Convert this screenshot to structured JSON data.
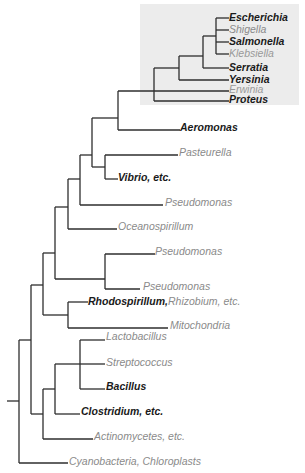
{
  "diagram": {
    "type": "phylogenetic-tree",
    "highlight_box": {
      "color": "#ececec"
    },
    "line_color": "#2e2e2e",
    "colors": {
      "highlighted_taxon": "#1a1a1a",
      "other_taxon": "#8a8a8a"
    },
    "taxa": [
      {
        "id": "escherichia",
        "label": "Escherichia",
        "emphasis": true
      },
      {
        "id": "shigella",
        "label": "Shigella",
        "emphasis": false
      },
      {
        "id": "salmonella",
        "label": "Salmonella",
        "emphasis": true
      },
      {
        "id": "klebsiella",
        "label": "Klebsiella",
        "emphasis": false
      },
      {
        "id": "serratia",
        "label": "Serratia",
        "emphasis": true
      },
      {
        "id": "yersinia",
        "label": "Yersinia",
        "emphasis": true
      },
      {
        "id": "erwinia",
        "label": "Erwinia",
        "emphasis": false
      },
      {
        "id": "proteus",
        "label": "Proteus",
        "emphasis": true
      },
      {
        "id": "aeromonas",
        "label": "Aeromonas",
        "emphasis": true
      },
      {
        "id": "pasteurella",
        "label": "Pasteurella",
        "emphasis": false
      },
      {
        "id": "vibrio",
        "label": "Vibrio, etc.",
        "emphasis": true
      },
      {
        "id": "pseudomonas-1",
        "label": "Pseudomonas",
        "emphasis": false
      },
      {
        "id": "oceanospirillum",
        "label": "Oceanospirillum",
        "emphasis": false
      },
      {
        "id": "pseudomonas-2",
        "label": "Pseudomonas",
        "emphasis": false
      },
      {
        "id": "pseudomonas-3",
        "label": "Pseudomonas",
        "emphasis": false
      },
      {
        "id": "rhodospirillum",
        "label": "Rhodospirillum,",
        "emphasis": true
      },
      {
        "id": "rhizobium",
        "label": "Rhizobium, etc.",
        "emphasis": false
      },
      {
        "id": "mitochondria",
        "label": "Mitochondria",
        "emphasis": false
      },
      {
        "id": "lactobacillus",
        "label": "Lactobacillus",
        "emphasis": false
      },
      {
        "id": "streptococcus",
        "label": "Streptococcus",
        "emphasis": false
      },
      {
        "id": "bacillus",
        "label": "Bacillus",
        "emphasis": true
      },
      {
        "id": "clostridium",
        "label": "Clostridium, etc.",
        "emphasis": true
      },
      {
        "id": "actinomycetes",
        "label": "Actinomycetes, etc.",
        "emphasis": false
      },
      {
        "id": "cyanobacteria",
        "label": "Cyanobacteria, Chloroplasts",
        "emphasis": false
      }
    ]
  }
}
